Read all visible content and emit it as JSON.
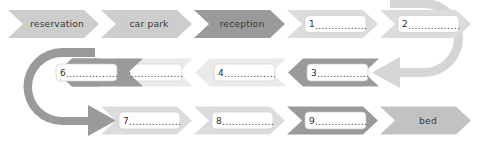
{
  "diagram": {
    "type": "serpentine-process-flow",
    "palette": {
      "light": "#cdcdcd",
      "lighter": "#dcdcdc",
      "very_light": "#eaeaea",
      "medium": "#c2c2c2",
      "dark": "#9a9a9a",
      "connector_light": "#d5d5d5",
      "connector_dark": "#9a9a9a",
      "text": "#3a3a3a",
      "box_fill": "#ffffff",
      "box_stroke": "#cfcfcf",
      "background": "#ffffff"
    },
    "dots": "................",
    "rows": [
      {
        "id": "row-1",
        "direction": "right",
        "steps": [
          {
            "id": "step-reservation",
            "kind": "label",
            "label": "reservation",
            "shade": "light"
          },
          {
            "id": "step-car-park",
            "kind": "label",
            "label": "car park",
            "shade": "light"
          },
          {
            "id": "step-reception",
            "kind": "label",
            "label": "reception",
            "shade": "dark"
          },
          {
            "id": "step-blank-1",
            "kind": "blank",
            "number": "1",
            "shade": "lighter"
          },
          {
            "id": "step-blank-2",
            "kind": "blank",
            "number": "2",
            "shade": "lighter"
          }
        ]
      },
      {
        "id": "row-2",
        "direction": "left",
        "steps": [
          {
            "id": "step-blank-6",
            "kind": "blank",
            "number": "6",
            "shade": "dark"
          },
          {
            "id": "step-blank-5",
            "kind": "blank",
            "number": "5",
            "shade": "very_light"
          },
          {
            "id": "step-blank-4",
            "kind": "blank",
            "number": "4",
            "shade": "very_light"
          },
          {
            "id": "step-blank-3",
            "kind": "blank",
            "number": "3",
            "shade": "dark"
          }
        ]
      },
      {
        "id": "row-3",
        "direction": "right",
        "steps": [
          {
            "id": "step-blank-7",
            "kind": "blank",
            "number": "7",
            "shade": "lighter"
          },
          {
            "id": "step-blank-8",
            "kind": "blank",
            "number": "8",
            "shade": "lighter"
          },
          {
            "id": "step-blank-9",
            "kind": "blank",
            "number": "9",
            "shade": "dark"
          },
          {
            "id": "step-bed",
            "kind": "label",
            "label": "bed",
            "shade": "medium"
          }
        ]
      }
    ],
    "connectors": [
      {
        "id": "connector-right-uturn",
        "shade": "connector_light",
        "from_row": "row-1",
        "to_row": "row-2"
      },
      {
        "id": "connector-left-uturn",
        "shade": "connector_dark",
        "from_row": "row-2",
        "to_row": "row-3"
      }
    ]
  }
}
